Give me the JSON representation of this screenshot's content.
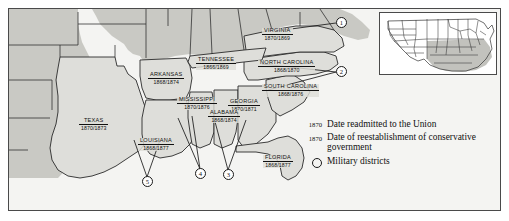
{
  "map": {
    "title": "Reconstruction of the South",
    "land_color": "#c9c9c4",
    "confederate_color": "#dededa",
    "water_color": "#f4f4f2",
    "border_color": "#2a2a2a",
    "states": [
      {
        "id": "virginia",
        "name": "VIRGINIA",
        "readmitted": "1870",
        "conservative": "1869",
        "dates": "1870/1869",
        "x": 262,
        "y": 28
      },
      {
        "id": "tennessee",
        "name": "TENNESSEE",
        "readmitted": "1866",
        "conservative": "1869",
        "dates": "1866/1869",
        "x": 196,
        "y": 57
      },
      {
        "id": "north-carolina",
        "name": "NORTH CAROLINA",
        "readmitted": "1868",
        "conservative": "1870",
        "dates": "1868/1870",
        "x": 258,
        "y": 60
      },
      {
        "id": "arkansas",
        "name": "ARKANSAS",
        "readmitted": "1868",
        "conservative": "1874",
        "dates": "1868/1874",
        "x": 148,
        "y": 72
      },
      {
        "id": "south-carolina",
        "name": "SOUTH CAROLINA",
        "readmitted": "1868",
        "conservative": "1876",
        "dates": "1868/1876",
        "x": 262,
        "y": 84
      },
      {
        "id": "mississippi",
        "name": "MISSISSIPPI",
        "readmitted": "1870",
        "conservative": "1876",
        "dates": "1870/1876",
        "x": 177,
        "y": 97
      },
      {
        "id": "georgia",
        "name": "GEORGIA",
        "readmitted": "1870",
        "conservative": "1871",
        "dates": "1870/1871",
        "x": 228,
        "y": 99
      },
      {
        "id": "alabama",
        "name": "ALABAMA",
        "readmitted": "1868",
        "conservative": "1874",
        "dates": "1868/1874",
        "x": 208,
        "y": 110
      },
      {
        "id": "texas",
        "name": "TEXAS",
        "readmitted": "1870",
        "conservative": "1873",
        "dates": "1870/1873",
        "x": 79,
        "y": 118
      },
      {
        "id": "louisiana",
        "name": "LOUISIANA",
        "readmitted": "1868",
        "conservative": "1877",
        "dates": "1868/1877",
        "x": 138,
        "y": 138
      },
      {
        "id": "florida",
        "name": "FLORIDA",
        "readmitted": "1868",
        "conservative": "1877",
        "dates": "1868/1877",
        "x": 263,
        "y": 155
      }
    ],
    "military_districts": [
      {
        "label": "1",
        "x": 341,
        "y": 23
      },
      {
        "label": "2",
        "x": 341,
        "y": 72
      },
      {
        "label": "3",
        "x": 228,
        "y": 175
      },
      {
        "label": "4",
        "x": 200,
        "y": 174
      },
      {
        "label": "5",
        "x": 147,
        "y": 182
      }
    ]
  },
  "legend": {
    "items": [
      {
        "id": "readmitted",
        "key": "1870",
        "key_type": "year",
        "text": "Date readmitted to the Union"
      },
      {
        "id": "conservative",
        "key": "1870",
        "key_type": "year",
        "text": "Date of reestablishment of conservative government"
      },
      {
        "id": "districts",
        "key": "",
        "key_type": "circle",
        "text": "Military districts"
      }
    ]
  },
  "inset": {
    "name": "united-states-locator-map",
    "highlight_color": "#c2c2bd"
  }
}
